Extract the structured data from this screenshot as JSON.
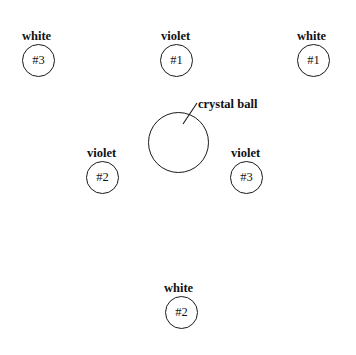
{
  "diagram": {
    "background_color": "#ffffff",
    "stroke_color": "#1a1a1a",
    "text_color": "#111111",
    "center": {
      "label": "crystal ball",
      "shape": "circle",
      "cx": 178,
      "cy": 142,
      "radius": 30,
      "label_x": 198,
      "label_y": 98,
      "leader_line": {
        "x1": 196,
        "y1": 104,
        "x2": 184,
        "y2": 123
      }
    },
    "nodes": [
      {
        "label": "white",
        "id": "#3",
        "cx": 38,
        "cy": 60,
        "radius": 16,
        "label_x": 22,
        "label_y": 30
      },
      {
        "label": "violet",
        "id": "#1",
        "cx": 176,
        "cy": 60,
        "radius": 16,
        "label_x": 161,
        "label_y": 30
      },
      {
        "label": "white",
        "id": "#1",
        "cx": 313,
        "cy": 60,
        "radius": 16,
        "label_x": 297,
        "label_y": 30
      },
      {
        "label": "violet",
        "id": "#2",
        "cx": 102,
        "cy": 177,
        "radius": 16,
        "label_x": 87,
        "label_y": 147
      },
      {
        "label": "violet",
        "id": "#3",
        "cx": 246,
        "cy": 177,
        "radius": 16,
        "label_x": 231,
        "label_y": 147
      },
      {
        "label": "white",
        "id": "#2",
        "cx": 181,
        "cy": 312,
        "radius": 16,
        "label_x": 164,
        "label_y": 282
      }
    ]
  }
}
